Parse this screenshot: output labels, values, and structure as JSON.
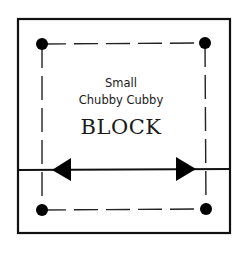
{
  "diagram": {
    "label_line1": "Small",
    "label_line2": "Chubby Cubby",
    "title": "BLOCK",
    "colors": {
      "stroke": "#111111",
      "background": "#ffffff"
    },
    "elements": {
      "outer_square": "solid-border",
      "inner_square": "dashed-border",
      "corner_markers": [
        "top-left-dot",
        "top-right-dot",
        "bottom-left-dot",
        "bottom-right-dot"
      ],
      "grainline": "double-headed-arrow"
    }
  }
}
